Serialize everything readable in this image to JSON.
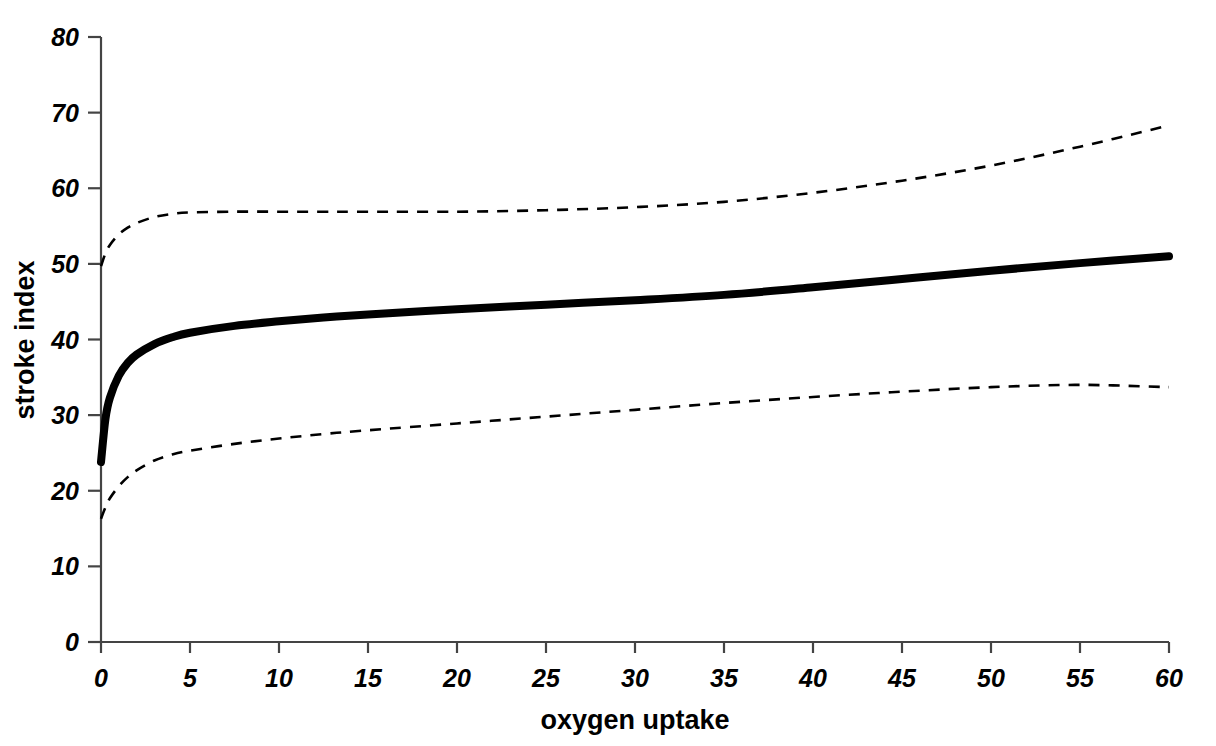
{
  "chart_data": {
    "type": "line",
    "title": "",
    "xlabel": "oxygen uptake",
    "ylabel": "stroke index",
    "xlim": [
      0,
      60
    ],
    "ylim": [
      0,
      80
    ],
    "xticks": [
      0,
      5,
      10,
      15,
      20,
      25,
      30,
      35,
      40,
      45,
      50,
      55,
      60
    ],
    "yticks": [
      0,
      10,
      20,
      30,
      40,
      50,
      60,
      70,
      80
    ],
    "grid": false,
    "legend": "none",
    "x": [
      0,
      0.25,
      0.5,
      1,
      1.5,
      2,
      3,
      4,
      5,
      7.5,
      10,
      12.5,
      15,
      20,
      25,
      30,
      35,
      40,
      45,
      50,
      55,
      60
    ],
    "series": [
      {
        "name": "fitted curve",
        "style": "solid",
        "linewidth": "thick",
        "color": "#000000",
        "values": [
          23.8,
          29.5,
          32.3,
          35.2,
          36.9,
          38.0,
          39.4,
          40.3,
          40.9,
          41.8,
          42.4,
          42.9,
          43.3,
          44.0,
          44.6,
          45.2,
          45.9,
          46.9,
          48.0,
          49.1,
          50.1,
          51.0
        ]
      },
      {
        "name": "upper confidence limit",
        "style": "dashed",
        "linewidth": "thin",
        "color": "#000000",
        "values": [
          49.7,
          51.4,
          52.5,
          53.9,
          54.8,
          55.4,
          56.2,
          56.6,
          56.8,
          56.9,
          56.9,
          56.9,
          56.9,
          56.9,
          57.1,
          57.5,
          58.2,
          59.4,
          61.0,
          63.0,
          65.5,
          68.3
        ]
      },
      {
        "name": "lower confidence limit",
        "style": "dashed",
        "linewidth": "thin",
        "color": "#000000",
        "values": [
          16.3,
          17.8,
          19.0,
          20.6,
          21.8,
          22.7,
          24.0,
          24.8,
          25.3,
          26.2,
          26.9,
          27.5,
          28.0,
          28.9,
          29.8,
          30.7,
          31.6,
          32.4,
          33.1,
          33.7,
          34.0,
          33.7
        ]
      }
    ]
  },
  "axes": {
    "x_tick_labels": [
      "0",
      "5",
      "10",
      "15",
      "20",
      "25",
      "30",
      "35",
      "40",
      "45",
      "50",
      "55",
      "60"
    ],
    "y_tick_labels": [
      "0",
      "10",
      "20",
      "30",
      "40",
      "50",
      "60",
      "70",
      "80"
    ],
    "x_title": "oxygen uptake",
    "y_title": "stroke index"
  }
}
